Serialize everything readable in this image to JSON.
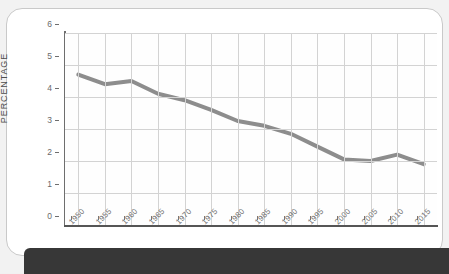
{
  "chart_data": {
    "type": "line",
    "title": "",
    "xlabel": "",
    "ylabel": "PERCENTAGE",
    "categories": [
      "1950",
      "1955",
      "1960",
      "1965",
      "1970",
      "1975",
      "1980",
      "1985",
      "1990",
      "1995",
      "2000",
      "2005",
      "2010",
      "2015"
    ],
    "values": [
      4.7,
      4.4,
      4.5,
      4.1,
      3.9,
      3.6,
      3.25,
      3.1,
      2.85,
      2.45,
      2.05,
      2.0,
      2.2,
      1.9
    ],
    "series": [
      {
        "name": "percentage",
        "values": [
          4.7,
          4.4,
          4.5,
          4.1,
          3.9,
          3.6,
          3.25,
          3.1,
          2.85,
          2.45,
          2.05,
          2.0,
          2.2,
          1.9
        ]
      }
    ],
    "ylim": [
      0,
      6
    ],
    "yticks": [
      "0",
      "1",
      "2",
      "3",
      "4",
      "5",
      "6"
    ],
    "xlim": [
      "1950",
      "2015"
    ],
    "grid": true,
    "legend": false,
    "line_color": "#8d8d8d",
    "grid_color": "#d3d3d3",
    "axis_color": "#6e6e6e",
    "plot_background": "#fefefe"
  },
  "card": {
    "background": "#ffffff",
    "border_color": "#c9c9c9"
  },
  "footer": {
    "background": "#373737",
    "label": ""
  },
  "watermark": {
    "text": ""
  }
}
